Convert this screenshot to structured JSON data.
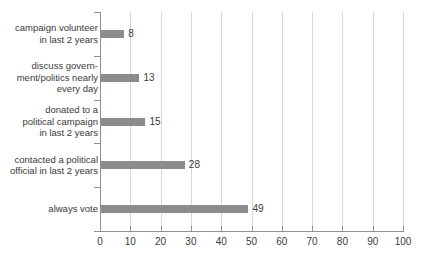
{
  "chart_data": {
    "type": "bar",
    "orientation": "horizontal",
    "title": "",
    "subtitle": "",
    "xlabel": "",
    "ylabel": "",
    "categories": [
      "campaign volunteer\nin last 2 years",
      "discuss govern-\nment/politics nearly\nevery day",
      "donated to a\npolitical campaign\nin last 2 years",
      "contacted a political\nofficial in last 2 years",
      "always vote"
    ],
    "values": [
      8,
      13,
      15,
      28,
      49
    ],
    "value_labels": [
      "8",
      "13",
      "15",
      "28",
      "49"
    ],
    "xlim": [
      0,
      100
    ],
    "xticks": [
      0,
      10,
      20,
      30,
      40,
      50,
      60,
      70,
      80,
      90,
      100
    ],
    "xtick_labels": [
      "0",
      "10",
      "20",
      "30",
      "40",
      "50",
      "60",
      "70",
      "80",
      "90",
      "100"
    ],
    "grid": true,
    "grid_axis": "x",
    "legend": false,
    "legend_position": "none",
    "bar_color": "#8c8c8c",
    "grid_color": "#d7d7d7",
    "axis_color": "#8f8f8f",
    "text_color": "#3a3a3a",
    "background_color": "#ffffff"
  }
}
